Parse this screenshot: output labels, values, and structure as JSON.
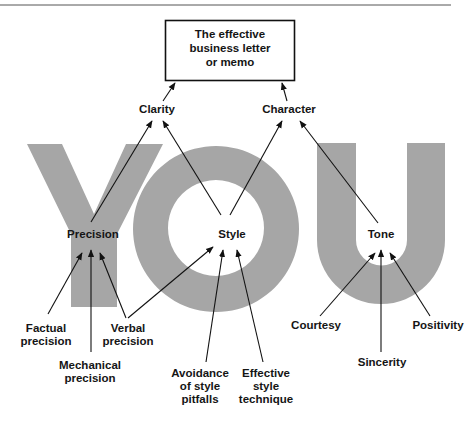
{
  "colors": {
    "letters": "#a6a6a6",
    "lines": "#111111",
    "rule": "#555555"
  },
  "goal": {
    "label": "The effective\nbusiness letter\nor memo"
  },
  "background_word": "YOU",
  "level1": [
    {
      "id": "clarity",
      "label": "Clarity"
    },
    {
      "id": "character",
      "label": "Character"
    }
  ],
  "level2": [
    {
      "id": "precision",
      "label": "Precision",
      "feeds": "clarity"
    },
    {
      "id": "style",
      "label": "Style",
      "feeds": [
        "clarity",
        "character"
      ]
    },
    {
      "id": "tone",
      "label": "Tone",
      "feeds": "character"
    }
  ],
  "level3": [
    {
      "id": "factual",
      "label": "Factual\nprecision",
      "feeds": "precision"
    },
    {
      "id": "mechanical",
      "label": "Mechanical\nprecision",
      "feeds": "precision"
    },
    {
      "id": "verbal",
      "label": "Verbal\nprecision",
      "feeds": [
        "precision",
        "style"
      ]
    },
    {
      "id": "avoidance",
      "label": "Avoidance\nof style\npitfalls",
      "feeds": "style"
    },
    {
      "id": "technique",
      "label": "Effective\nstyle\ntechnique",
      "feeds": "style"
    },
    {
      "id": "courtesy",
      "label": "Courtesy",
      "feeds": "tone"
    },
    {
      "id": "sincerity",
      "label": "Sincerity",
      "feeds": "tone"
    },
    {
      "id": "positivity",
      "label": "Positivity",
      "feeds": "tone"
    }
  ]
}
